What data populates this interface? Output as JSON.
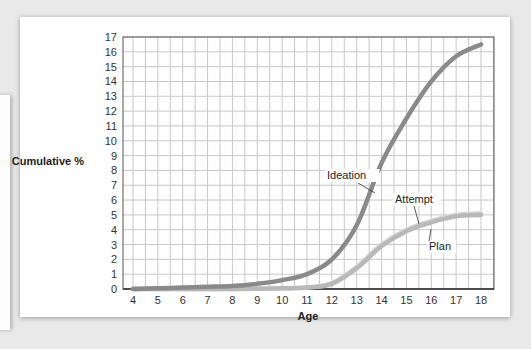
{
  "chart_data": {
    "type": "line",
    "title": "",
    "xlabel": "Age",
    "ylabel": "Cumulative %",
    "xlim": [
      4,
      18
    ],
    "ylim": [
      0,
      17
    ],
    "x_ticks": [
      4,
      5,
      6,
      7,
      8,
      9,
      10,
      11,
      12,
      13,
      14,
      15,
      16,
      17,
      18
    ],
    "y_ticks": [
      0,
      1,
      2,
      3,
      4,
      5,
      6,
      7,
      8,
      9,
      10,
      11,
      12,
      13,
      14,
      15,
      16,
      17
    ],
    "grid": true,
    "legend": "inline annotations",
    "x": [
      4,
      5,
      6,
      7,
      8,
      9,
      10,
      11,
      12,
      13,
      14,
      15,
      16,
      17,
      18
    ],
    "series": [
      {
        "name": "Ideation",
        "color": "#8a8a8a",
        "values": [
          0.0,
          0.05,
          0.1,
          0.15,
          0.2,
          0.35,
          0.6,
          1.0,
          2.0,
          4.3,
          8.5,
          11.5,
          14.0,
          15.7,
          16.5
        ]
      },
      {
        "name": "Attempt",
        "color": "#d7d7d7",
        "values": [
          0.0,
          0.0,
          0.0,
          0.0,
          0.0,
          0.02,
          0.05,
          0.1,
          0.4,
          1.5,
          3.0,
          4.0,
          4.6,
          5.0,
          5.1
        ]
      },
      {
        "name": "Plan",
        "color": "#b8b8b8",
        "values": [
          0.0,
          0.0,
          0.0,
          0.0,
          0.0,
          0.02,
          0.05,
          0.1,
          0.35,
          1.4,
          2.9,
          3.9,
          4.5,
          4.9,
          5.0
        ]
      }
    ],
    "annotations": [
      {
        "text": "Ideation",
        "x": 13.6,
        "y": 7.0
      },
      {
        "text": "Attempt",
        "x": 15.5,
        "y": 4.1
      },
      {
        "text": "Plan",
        "x": 16.0,
        "y": 4.6
      }
    ]
  },
  "labels": {
    "ylabel": "Cumulative %",
    "xlabel": "Age",
    "ideation": "Ideation",
    "attempt": "Attempt",
    "plan": "Plan"
  }
}
